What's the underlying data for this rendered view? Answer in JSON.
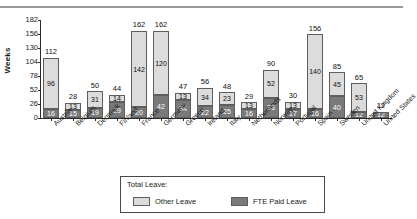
{
  "chart_data": {
    "type": "bar",
    "subtype": "stacked",
    "title": "",
    "xlabel": "",
    "ylabel": "Weeks",
    "ylim": [
      0,
      182
    ],
    "yticks": [
      0,
      26,
      52,
      78,
      104,
      130,
      156,
      182
    ],
    "grid": false,
    "legend_position": "bottom",
    "legend_title": "Total Leave:",
    "categories": [
      "Austria",
      "Belgium",
      "Denmark",
      "Finland",
      "France",
      "Germany",
      "Greece",
      "Ireland",
      "Italy",
      "Netherlands",
      "Norway",
      "Portugal",
      "Spain",
      "Sweden",
      "United Kingdom",
      "United States"
    ],
    "series": [
      {
        "name": "FTE Paid Leave",
        "color": "#7a7a7a",
        "values": [
          16,
          15,
          19,
          29,
          20,
          42,
          34,
          22,
          25,
          16,
          38,
          17,
          16,
          40,
          12,
          12
        ]
      },
      {
        "name": "Other Leave",
        "color": "#dcdcdc",
        "values": [
          96,
          13,
          31,
          14,
          142,
          120,
          13,
          34,
          23,
          13,
          52,
          13,
          140,
          45,
          53,
          0
        ]
      }
    ],
    "totals": [
      112,
      28,
      50,
      44,
      162,
      162,
      47,
      56,
      48,
      29,
      90,
      30,
      156,
      85,
      65,
      12
    ]
  },
  "legend": {
    "title": "Total Leave:",
    "entries": [
      {
        "label": "Other Leave",
        "color": "#dcdcdc"
      },
      {
        "label": "FTE Paid Leave",
        "color": "#7a7a7a"
      }
    ]
  }
}
